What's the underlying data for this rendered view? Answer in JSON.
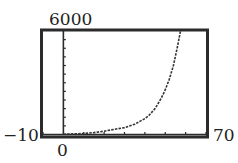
{
  "chart_data": {
    "type": "line",
    "title": "",
    "xlabel": "",
    "ylabel": "",
    "xlim": [
      -10,
      70
    ],
    "ylim": [
      0,
      6000
    ],
    "grid": false,
    "window_labels": {
      "ymax": "6000",
      "xmin": "−10",
      "xmax": "70",
      "origin": "0"
    },
    "x_tick_step": 10,
    "y_tick_step": 500,
    "series": [
      {
        "name": "y",
        "style": "dotted",
        "x": [
          0,
          5,
          10,
          15,
          20,
          25,
          30,
          35,
          40,
          42,
          45,
          48,
          50,
          52,
          54,
          56,
          57.5
        ],
        "y": [
          20,
          35,
          60,
          110,
          190,
          300,
          400,
          600,
          920,
          1100,
          1500,
          2100,
          2600,
          3200,
          4000,
          5100,
          6000
        ]
      }
    ]
  },
  "colors": {
    "frame": "#2b2b2b",
    "axis": "#2b2b2b",
    "curve": "#333333",
    "background": "#ffffff"
  }
}
